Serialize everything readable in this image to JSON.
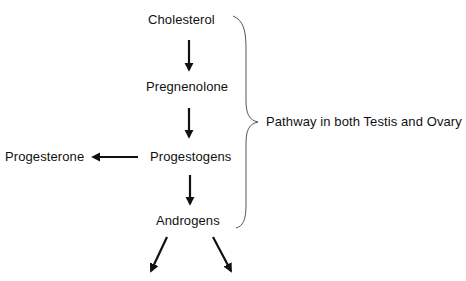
{
  "diagram": {
    "nodes": {
      "cholesterol": "Cholesterol",
      "pregnenolone": "Pregnenolone",
      "progestogens": "Progestogens",
      "progesterone": "Progesterone",
      "androgens": "Androgens"
    },
    "brace_label": "Pathway in both Testis and Ovary",
    "edges": [
      {
        "from": "Cholesterol",
        "to": "Pregnenolone"
      },
      {
        "from": "Pregnenolone",
        "to": "Progestogens"
      },
      {
        "from": "Progestogens",
        "to": "Progesterone"
      },
      {
        "from": "Progestogens",
        "to": "Androgens"
      },
      {
        "from": "Androgens",
        "to": "(unlabeled, down-left)"
      },
      {
        "from": "Androgens",
        "to": "(unlabeled, down-right)"
      }
    ],
    "colors": {
      "text": "#111111",
      "arrow": "#111111",
      "brace": "#555555",
      "background": "#ffffff"
    }
  }
}
